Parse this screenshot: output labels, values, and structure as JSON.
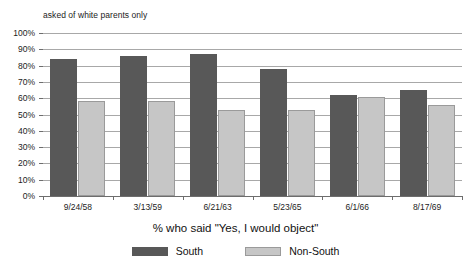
{
  "chart_data": {
    "type": "bar",
    "title": "",
    "subtitle": "asked of white parents only",
    "xlabel": "% who said \"Yes, I would object\"",
    "ylabel": "",
    "ylim": [
      0,
      100
    ],
    "ytick_labels": [
      "100%",
      "90%",
      "80%",
      "70%",
      "60%",
      "50%",
      "40%",
      "30%",
      "20%",
      "10%",
      "0%"
    ],
    "ytick_values": [
      100,
      90,
      80,
      70,
      60,
      50,
      40,
      30,
      20,
      10,
      0
    ],
    "grid": true,
    "legend_position": "bottom",
    "categories": [
      "9/24/58",
      "3/13/59",
      "6/21/63",
      "5/23/65",
      "6/1/66",
      "8/17/69"
    ],
    "series": [
      {
        "name": "South",
        "color": "#585858",
        "values": [
          84,
          86,
          87,
          78,
          62,
          65
        ]
      },
      {
        "name": "Non-South",
        "color": "#c6c6c6",
        "values": [
          58,
          58,
          53,
          53,
          61,
          56
        ]
      }
    ]
  }
}
